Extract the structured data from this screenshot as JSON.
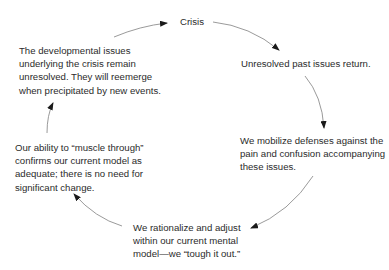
{
  "diagram": {
    "type": "cycle",
    "nodes": [
      {
        "id": "crisis",
        "lines": [
          "Crisis"
        ]
      },
      {
        "id": "unresolved",
        "lines": [
          "Unresolved past issues return."
        ]
      },
      {
        "id": "mobilize",
        "lines": [
          "We mobilize defenses against the",
          "pain and confusion accompanying",
          "these issues."
        ]
      },
      {
        "id": "rationalize",
        "lines": [
          "We rationalize and adjust",
          "within our current mental",
          "model—we “tough it out.”"
        ]
      },
      {
        "id": "muscle",
        "lines": [
          "Our ability to “muscle through”",
          "confirms our current model as",
          "adequate; there is no need for",
          "significant change."
        ]
      },
      {
        "id": "developmental",
        "lines": [
          "The developmental issues",
          "underlying the crisis remain",
          "unresolved. They will reemerge",
          "when precipitated by new events."
        ]
      }
    ],
    "edges": [
      {
        "from": "developmental",
        "to": "crisis"
      },
      {
        "from": "crisis",
        "to": "unresolved"
      },
      {
        "from": "unresolved",
        "to": "mobilize"
      },
      {
        "from": "mobilize",
        "to": "rationalize"
      },
      {
        "from": "rationalize",
        "to": "muscle"
      },
      {
        "from": "muscle",
        "to": "developmental"
      }
    ],
    "colors": {
      "text": "#2b2b2b",
      "arrow": "#808080",
      "arrowhead": "#1a1a1a"
    }
  }
}
